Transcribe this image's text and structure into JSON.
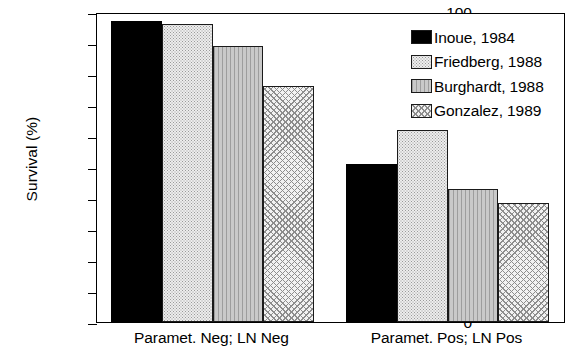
{
  "chart_data": {
    "type": "bar",
    "title": "",
    "xlabel": "",
    "ylabel": "Survival (%)",
    "ylim": [
      0,
      100
    ],
    "yticks": [
      100,
      90,
      80,
      70,
      60,
      50,
      40,
      30,
      20,
      10,
      0
    ],
    "grid": false,
    "legend_position": "upper right (inside plot frame)",
    "categories": [
      "Paramet. Neg; LN Neg",
      "Paramet. Pos; LN Pos"
    ],
    "series": [
      {
        "name": "Inoue, 1984",
        "pattern": "solid-black",
        "values": [
          97,
          51
        ]
      },
      {
        "name": "Friedberg, 1988",
        "pattern": "fine-stipple",
        "values": [
          96,
          62
        ]
      },
      {
        "name": "Burghardt, 1988",
        "pattern": "vertical-lines",
        "values": [
          89,
          43
        ]
      },
      {
        "name": "Gonzalez, 1989",
        "pattern": "cross-hatch",
        "values": [
          76,
          38.5
        ]
      }
    ]
  },
  "axis": {
    "y_title": "Survival (%)",
    "y_tick_labels": [
      "100",
      "90",
      "80",
      "70",
      "60",
      "50",
      "40",
      "30",
      "20",
      "10",
      "0"
    ]
  },
  "legend": {
    "items": [
      {
        "label": "Inoue, 1984"
      },
      {
        "label": "Friedberg, 1988"
      },
      {
        "label": "Burghardt, 1988"
      },
      {
        "label": "Gonzalez, 1989"
      }
    ]
  },
  "colors": {
    "axis": "#000000",
    "solid_series": "#000000",
    "stipple_series": "#ededed",
    "vlines_series": "#b8b8b8",
    "cross_series": "#f2f2f2",
    "background": "#ffffff"
  }
}
